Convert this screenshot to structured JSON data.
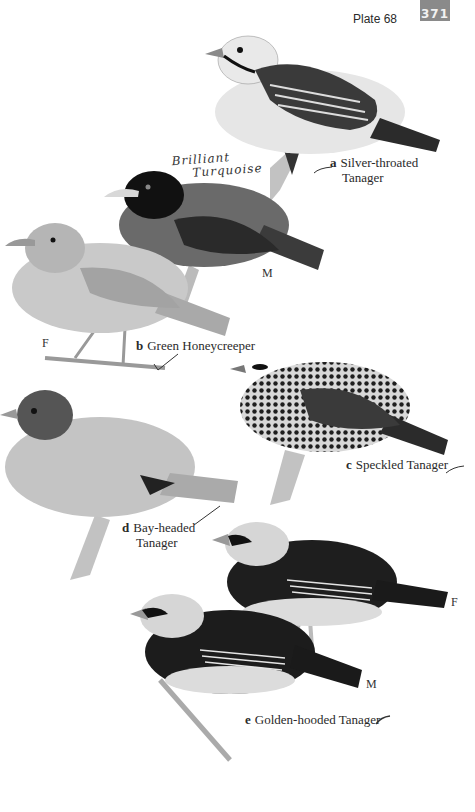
{
  "header": {
    "plate_label": "Plate 68",
    "page_number": "371",
    "badge_color": "#8a8a8a"
  },
  "annotations": {
    "handwritten_note_line1": "Brilliant",
    "handwritten_note_line2": "Turquoise"
  },
  "species": [
    {
      "letter": "a",
      "name_line1": "Silver-throated",
      "name_line2": "Tanager",
      "sexes": []
    },
    {
      "letter": "b",
      "name": "Green Honeycreeper",
      "sexes": [
        "M",
        "F"
      ]
    },
    {
      "letter": "c",
      "name": "Speckled Tanager",
      "sexes": []
    },
    {
      "letter": "d",
      "name_line1": "Bay-headed",
      "name_line2": "Tanager",
      "sexes": []
    },
    {
      "letter": "e",
      "name": "Golden-hooded Tanager",
      "sexes": [
        "F",
        "M"
      ]
    }
  ],
  "sex_labels": {
    "honeycreeper_male": "M",
    "honeycreeper_female": "F",
    "golden_hooded_female": "F",
    "golden_hooded_male": "M"
  }
}
